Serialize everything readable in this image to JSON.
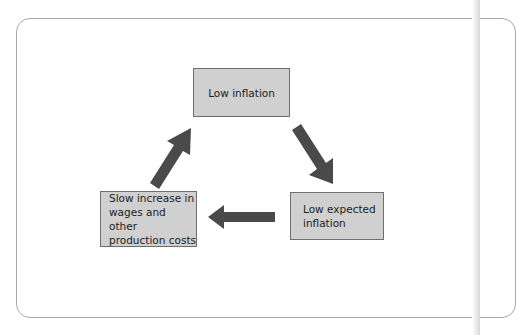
{
  "diagram": {
    "type": "cycle",
    "nodes": [
      {
        "id": "low_inflation",
        "label": "Low inflation"
      },
      {
        "id": "low_expected_inflation",
        "label": "Low expected\ninflation"
      },
      {
        "id": "slow_increase",
        "label": "Slow increase in\nwages and other\nproduction costs"
      }
    ],
    "edges": [
      {
        "from": "low_inflation",
        "to": "low_expected_inflation"
      },
      {
        "from": "low_expected_inflation",
        "to": "slow_increase"
      },
      {
        "from": "slow_increase",
        "to": "low_inflation"
      }
    ],
    "colors": {
      "box_fill": "#d0d0d0",
      "box_border": "#6e6e6e",
      "arrow": "#4a4a4a",
      "frame_border": "#a8a8a8"
    }
  }
}
